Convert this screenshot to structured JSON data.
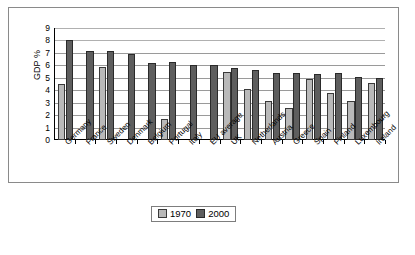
{
  "chart_data": {
    "type": "bar",
    "title": "",
    "xlabel": "",
    "ylabel": "GDP %",
    "ylim": [
      0,
      9
    ],
    "ytick_step": 1,
    "yticks": [
      "9",
      "8",
      "7",
      "6",
      "5",
      "4",
      "3",
      "2",
      "1",
      "0"
    ],
    "grid": true,
    "legend_position": "bottom-center",
    "categories": [
      "Germany",
      "France",
      "Sweden",
      "Denmark",
      "Belgium",
      "Portugal",
      "Italy",
      "EU average",
      "UK",
      "Netherlands",
      "Austria",
      "Greece",
      "Spain",
      "Finland",
      "Luxembourg",
      "Ireland"
    ],
    "series": [
      {
        "name": "1970",
        "color": "#b9b9b9",
        "values": [
          4.5,
          0,
          5.85,
          0,
          0,
          1.7,
          0,
          0,
          5.5,
          4.1,
          3.1,
          2.6,
          4.9,
          3.8,
          3.1,
          4.6
        ]
      },
      {
        "name": "2000",
        "color": "#5e5e5e",
        "values": [
          8.0,
          7.15,
          7.15,
          6.9,
          6.2,
          6.25,
          6.0,
          6.0,
          5.8,
          5.65,
          5.4,
          5.35,
          5.3,
          5.35,
          5.1,
          5.0
        ]
      }
    ]
  },
  "legend": {
    "entries": [
      {
        "label": "1970",
        "swatch": "swatch-1970"
      },
      {
        "label": "2000",
        "swatch": "swatch-2000"
      }
    ]
  }
}
